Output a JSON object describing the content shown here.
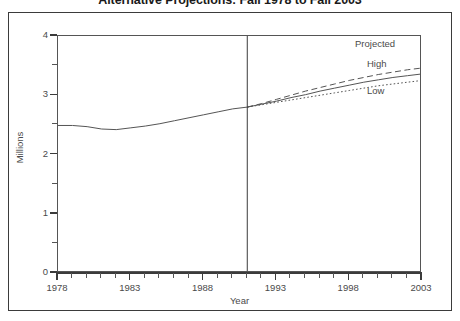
{
  "chart_data": {
    "type": "line",
    "title": "Alternative Projections: Fall 1978 to Fall 2003",
    "xlabel": "Year",
    "ylabel": "Millions",
    "xlim": [
      1978,
      2003
    ],
    "ylim": [
      0,
      4
    ],
    "grid": false,
    "legend_position": "in-plot annotations",
    "y_ticks_major": [
      0,
      1,
      2,
      3,
      4
    ],
    "y_tick_labels": [
      "0",
      "1",
      "2",
      "3",
      "4"
    ],
    "y_ticks_minor": [
      0.5,
      1.5,
      2.5,
      3.5
    ],
    "x_ticks_major": [
      1978,
      1983,
      1988,
      1993,
      1998,
      2003
    ],
    "x_tick_labels": [
      "1978",
      "1983",
      "1988",
      "1993",
      "1998",
      "2003"
    ],
    "x_ticks_minor": [
      1979,
      1980,
      1981,
      1982,
      1984,
      1985,
      1986,
      1987,
      1989,
      1990,
      1991,
      1992,
      1994,
      1995,
      1996,
      1997,
      1999,
      2000,
      2001,
      2002
    ],
    "projection_divider_year": 1991,
    "annotations": [
      {
        "name": "projected",
        "text": "Projected"
      },
      {
        "name": "high",
        "text": "High"
      },
      {
        "name": "low",
        "text": "Low"
      }
    ],
    "series": [
      {
        "name": "Actual",
        "style": "solid",
        "color": "#555555",
        "x": [
          1978,
          1979,
          1980,
          1981,
          1982,
          1983,
          1984,
          1985,
          1986,
          1987,
          1988,
          1989,
          1990,
          1991
        ],
        "values": [
          2.49,
          2.49,
          2.47,
          2.43,
          2.42,
          2.45,
          2.48,
          2.52,
          2.57,
          2.62,
          2.67,
          2.72,
          2.77,
          2.8
        ]
      },
      {
        "name": "High",
        "style": "dashed",
        "color": "#555555",
        "x": [
          1991,
          1992,
          1993,
          1994,
          1995,
          1996,
          1997,
          1998,
          1999,
          2000,
          2001,
          2002,
          2003
        ],
        "values": [
          2.8,
          2.86,
          2.93,
          3.0,
          3.07,
          3.13,
          3.19,
          3.25,
          3.3,
          3.35,
          3.39,
          3.43,
          3.46
        ]
      },
      {
        "name": "Middle",
        "style": "solid",
        "color": "#555555",
        "x": [
          1991,
          1992,
          1993,
          1994,
          1995,
          1996,
          1997,
          1998,
          1999,
          2000,
          2001,
          2002,
          2003
        ],
        "values": [
          2.8,
          2.85,
          2.9,
          2.96,
          3.01,
          3.07,
          3.12,
          3.17,
          3.22,
          3.26,
          3.3,
          3.33,
          3.36
        ]
      },
      {
        "name": "Low",
        "style": "dotted",
        "color": "#555555",
        "x": [
          1991,
          1992,
          1993,
          1994,
          1995,
          1996,
          1997,
          1998,
          1999,
          2000,
          2001,
          2002,
          2003
        ],
        "values": [
          2.8,
          2.84,
          2.88,
          2.92,
          2.96,
          3.0,
          3.04,
          3.08,
          3.12,
          3.16,
          3.19,
          3.22,
          3.25
        ]
      }
    ]
  },
  "colors": {
    "frame": "#3b3b3b",
    "axis": "#3b3b3b",
    "line": "#555555",
    "text": "#4a4a4a",
    "title": "#1a1a1a",
    "background": "#ffffff"
  }
}
